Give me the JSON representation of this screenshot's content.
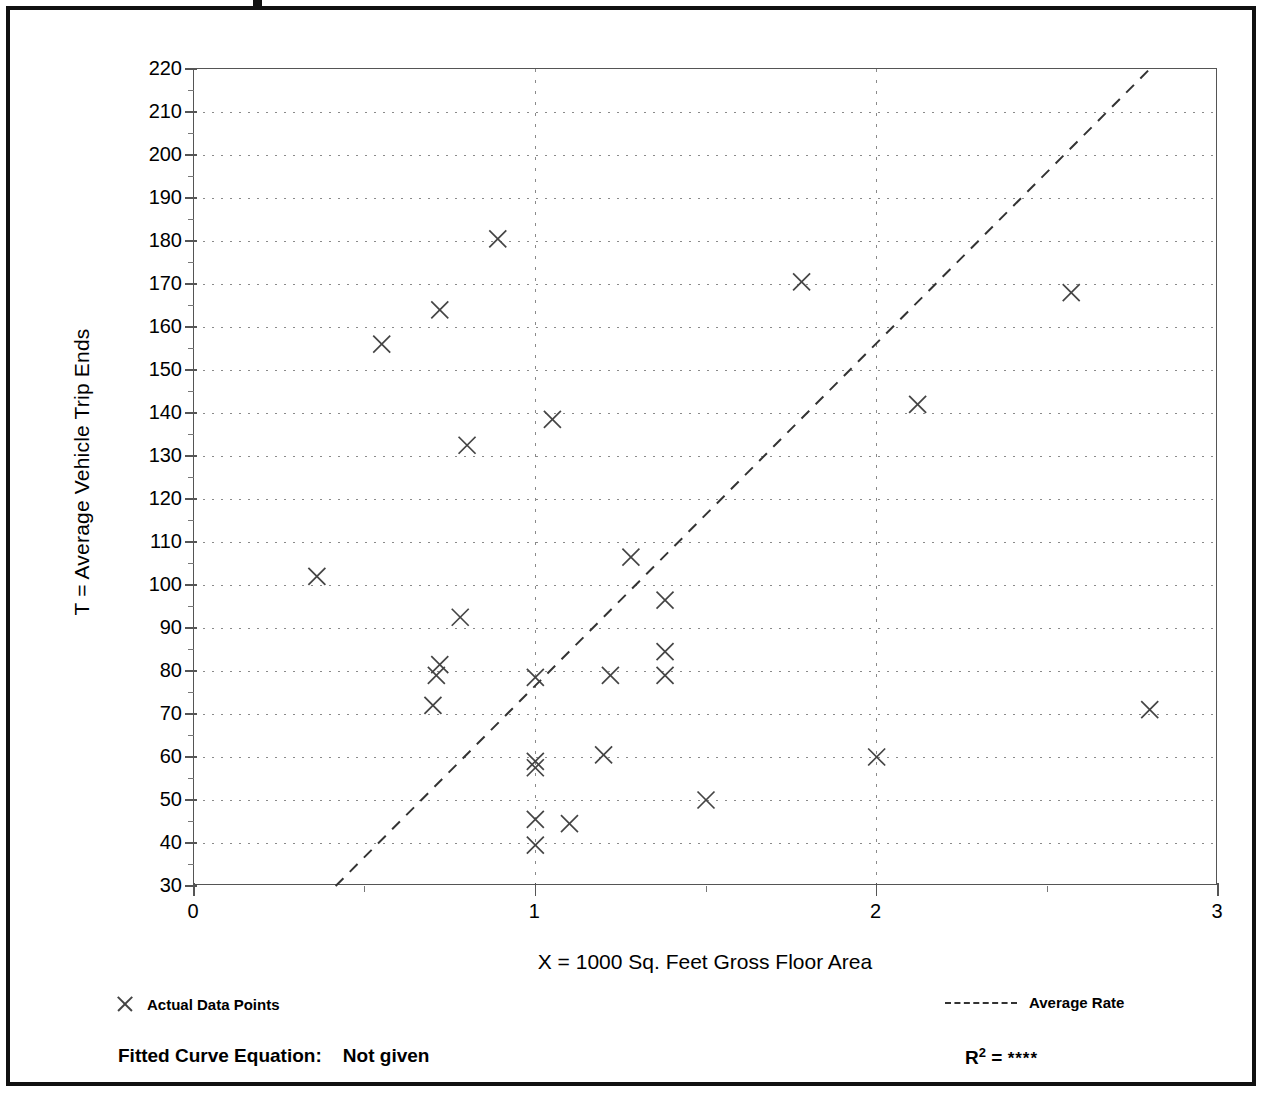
{
  "figure": {
    "frame_border_color": "#111111",
    "background": "#ffffff"
  },
  "axes": {
    "ylabel": "T = Average Vehicle Trip Ends",
    "xlabel": "X = 1000 Sq. Feet Gross Floor Area"
  },
  "legend": {
    "points_label": "Actual Data Points",
    "points_marker": "x-marker-icon",
    "rate_label": "Average Rate",
    "rate_marker": "dashed-line-icon"
  },
  "footer": {
    "fitted_label": "Fitted Curve Equation:",
    "fitted_value": "Not given",
    "r2_symbol": "R",
    "r2_exponent": "2",
    "r2_equals": "=",
    "r2_value": "****"
  },
  "chart_data": {
    "type": "scatter",
    "title": "",
    "xlabel": "X = 1000 Sq. Feet Gross Floor Area",
    "ylabel": "T = Average Vehicle Trip Ends",
    "xlim": [
      0,
      3
    ],
    "ylim": [
      30,
      220
    ],
    "xticks": [
      0,
      1,
      2,
      3
    ],
    "xtick_labels": [
      "0",
      "1",
      "2",
      "3"
    ],
    "xminor_ticks": [
      0.5,
      1.5,
      2.5
    ],
    "yticks": [
      30,
      40,
      50,
      60,
      70,
      80,
      90,
      100,
      110,
      120,
      130,
      140,
      150,
      160,
      170,
      180,
      190,
      200,
      210,
      220
    ],
    "ytick_labels": [
      "30",
      "40",
      "50",
      "60",
      "70",
      "80",
      "90",
      "100",
      "110",
      "120",
      "130",
      "140",
      "150",
      "160",
      "170",
      "180",
      "190",
      "200",
      "210",
      "220"
    ],
    "yminor_ticks": [
      35,
      45,
      55,
      65,
      75,
      85,
      95,
      105,
      115,
      125,
      135,
      145,
      155,
      165,
      175,
      185,
      195,
      205,
      215
    ],
    "grid": {
      "horizontal": true,
      "vertical": true,
      "style": "dotted",
      "color": "#8a8a8a",
      "vertical_at": [
        1,
        2
      ]
    },
    "legend_position": "below-axes",
    "series": [
      {
        "name": "Actual Data Points",
        "type": "scatter",
        "marker": "x",
        "color": "#444444",
        "points": [
          [
            0.36,
            102
          ],
          [
            0.55,
            156
          ],
          [
            0.7,
            72
          ],
          [
            0.71,
            79
          ],
          [
            0.72,
            81.5
          ],
          [
            0.72,
            164
          ],
          [
            0.78,
            92.5
          ],
          [
            0.8,
            132.5
          ],
          [
            0.89,
            180.5
          ],
          [
            1.0,
            39.5
          ],
          [
            1.0,
            45.5
          ],
          [
            1.0,
            57.5
          ],
          [
            1.0,
            59
          ],
          [
            1.0,
            78.5
          ],
          [
            1.05,
            138.5
          ],
          [
            1.1,
            44.5
          ],
          [
            1.2,
            60.5
          ],
          [
            1.22,
            79
          ],
          [
            1.28,
            106.5
          ],
          [
            1.38,
            79
          ],
          [
            1.38,
            84.5
          ],
          [
            1.38,
            96.5
          ],
          [
            1.5,
            50
          ],
          [
            1.78,
            170.5
          ],
          [
            2.0,
            60
          ],
          [
            2.12,
            142
          ],
          [
            2.57,
            168
          ],
          [
            2.8,
            71
          ]
        ]
      },
      {
        "name": "Average Rate",
        "type": "line",
        "style": "dashed",
        "color": "#333333",
        "endpoints": [
          [
            0.415,
            30
          ],
          [
            2.8,
            220
          ]
        ]
      }
    ]
  }
}
